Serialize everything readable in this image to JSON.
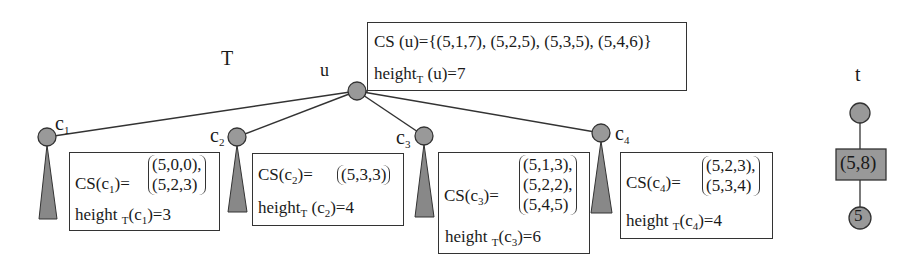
{
  "tree_T": {
    "label": "T",
    "root": {
      "label": "u",
      "cs_prefix": "CS (u)=",
      "cs": "{(5,1,7), (5,2,5), (5,3,5), (5,4,6)}",
      "height_prefix": "height",
      "height_sub": "T",
      "height_suffix": " (u)=7"
    },
    "children": [
      {
        "label": "c",
        "sub": "1",
        "cs_prefix": "CS(c",
        "cs_sub": "1",
        "cs_suffix": ")= ",
        "tuples": [
          "(5,0,0),",
          "(5,2,3)"
        ],
        "height_prefix": "height ",
        "height_sub": "T",
        "height_arg": "(c",
        "height_arg_sub": "1",
        "height_suffix": ")=3"
      },
      {
        "label": "c",
        "sub": "2",
        "cs_prefix": "CS(c",
        "cs_sub": "2",
        "cs_suffix": ")= ",
        "tuples": [
          "(5,3,3)"
        ],
        "height_prefix": "height",
        "height_sub": "T",
        "height_arg": " (c",
        "height_arg_sub": "2",
        "height_suffix": ")=4"
      },
      {
        "label": "c",
        "sub": "3",
        "cs_prefix": "CS(c",
        "cs_sub": "3",
        "cs_suffix": ")= ",
        "tuples": [
          "(5,1,3),",
          "(5,2,2),",
          "(5,4,5)"
        ],
        "height_prefix": "height ",
        "height_sub": "T",
        "height_arg": "(c",
        "height_arg_sub": "3",
        "height_suffix": ")=6"
      },
      {
        "label": "c",
        "sub": "4",
        "cs_prefix": "CS(c",
        "cs_sub": "4",
        "cs_suffix": ")= ",
        "tuples": [
          "(5,2,3),",
          "(5,3,4)"
        ],
        "height_prefix": "height ",
        "height_sub": "T",
        "height_arg": "(c",
        "height_arg_sub": "4",
        "height_suffix": ")=4"
      }
    ]
  },
  "tree_t": {
    "label": "t",
    "edge_label": "(5,8)",
    "leaf_label": "5"
  },
  "colors": {
    "node_fill": "#999999",
    "node_stroke": "#333333",
    "line": "#333333"
  }
}
